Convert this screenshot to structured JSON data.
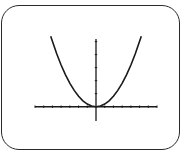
{
  "chart_data": {
    "type": "line",
    "title": "",
    "xlabel": "",
    "ylabel": "",
    "function": "y = 0.2x^2",
    "xlim": [
      -7,
      7
    ],
    "ylim": [
      -1.1,
      5.2
    ],
    "x_ticks": [
      -7,
      -6,
      -5,
      -4,
      -3,
      -2,
      -1,
      1,
      2,
      3,
      4,
      5,
      6,
      7
    ],
    "y_ticks": [
      1,
      2,
      3,
      4,
      5
    ],
    "x_tick_labels": [],
    "y_tick_labels": [],
    "grid": false,
    "legend": "none",
    "series": [
      {
        "name": "parabola",
        "x": [
          -5.2,
          -4.5,
          -4,
          -3.5,
          -3,
          -2.5,
          -2,
          -1.5,
          -1,
          -0.5,
          0,
          0.5,
          1,
          1.5,
          2,
          2.5,
          3,
          3.5,
          4,
          4.5,
          5.2
        ],
        "y": [
          5.41,
          4.05,
          3.2,
          2.45,
          1.8,
          1.25,
          0.8,
          0.45,
          0.2,
          0.05,
          0,
          0.05,
          0.2,
          0.45,
          0.8,
          1.25,
          1.8,
          2.45,
          3.2,
          4.05,
          5.41
        ]
      }
    ],
    "colors": {
      "curve": "#1a1a1a",
      "axes": "#1a1a1a",
      "frame": "#2a2a2a"
    }
  }
}
